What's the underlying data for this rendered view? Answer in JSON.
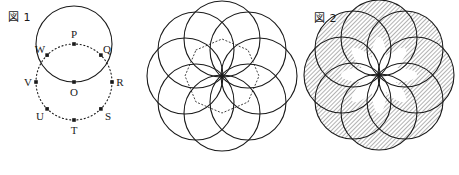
{
  "page": {
    "background_color": "#ffffff",
    "ink_color": "#1a1a1a",
    "width": 459,
    "height": 175
  },
  "figures": [
    {
      "id": "figure-1",
      "label": "図 1",
      "description": "Solid circle centered at P and dotted circle centered at O with eight marked points",
      "center_label": "O",
      "solid_circle": {
        "center_label": "P",
        "radius": 38
      },
      "dotted_circle": {
        "center_label": "O",
        "radius": 38
      },
      "points": [
        {
          "name": "P",
          "label": "P",
          "angle_deg": 270,
          "label_side": "top"
        },
        {
          "name": "Q",
          "label": "Q",
          "angle_deg": 315,
          "label_side": "upper-right"
        },
        {
          "name": "R",
          "label": "R",
          "angle_deg": 0,
          "label_side": "right"
        },
        {
          "name": "S",
          "label": "S",
          "angle_deg": 45,
          "label_side": "lower-right"
        },
        {
          "name": "T",
          "label": "T",
          "angle_deg": 90,
          "label_side": "bottom"
        },
        {
          "name": "U",
          "label": "U",
          "angle_deg": 135,
          "label_side": "lower-left"
        },
        {
          "name": "V",
          "label": "V",
          "angle_deg": 180,
          "label_side": "left"
        },
        {
          "name": "W",
          "label": "W",
          "angle_deg": 225,
          "label_side": "upper-left"
        },
        {
          "name": "O",
          "label": "O",
          "angle_deg": null,
          "label_side": "center-bottom"
        }
      ]
    },
    {
      "id": "figure-middle",
      "label": "",
      "description": "Rosette of eight solid circles centered on P,Q,R,S,T,U,V,W all passing through O, with dotted octagon joining the centers",
      "circle_count": 8,
      "circle_radius": 38,
      "dotted_polygon": "octagon"
    },
    {
      "id": "figure-2",
      "label": "図 2",
      "description": "Same eight-circle rosette with the union region hatched with 45 degree diagonal lines, leaving the eight central petals white",
      "circle_count": 8,
      "circle_radius": 38,
      "hatch_angle_deg": 45,
      "hatch_spacing_px": 3,
      "unhatched_region": "eight central petals"
    }
  ]
}
